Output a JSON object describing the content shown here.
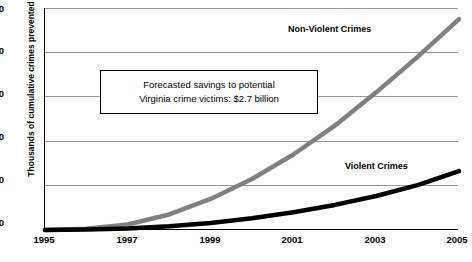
{
  "chart_data": {
    "type": "line",
    "title": "",
    "xlabel": "",
    "ylabel": "Thousands of cumulative crimes prevented",
    "xlim": [
      1995,
      2005
    ],
    "ylim": [
      0,
      100
    ],
    "grid": true,
    "legend_position": "inline-labels",
    "x_ticks": [
      "1995",
      "1997",
      "1999",
      "2001",
      "2003",
      "2005"
    ],
    "y_ticks": [
      "0",
      "20",
      "40",
      "60",
      "80",
      "100"
    ],
    "x": [
      1995,
      1996,
      1997,
      1998,
      1999,
      2000,
      2001,
      2002,
      2003,
      2004,
      2005
    ],
    "series": [
      {
        "name": "Non-Violent Crimes",
        "color": "#808080",
        "values": [
          0,
          0.6,
          2.5,
          7.0,
          14.0,
          23.0,
          34.0,
          47.0,
          62.0,
          78.0,
          95.0
        ]
      },
      {
        "name": "Violent Crimes",
        "color": "#000000",
        "values": [
          0,
          0.2,
          0.7,
          1.7,
          3.2,
          5.3,
          8.0,
          11.3,
          15.3,
          20.2,
          26.5
        ]
      }
    ],
    "annotations": [
      {
        "name": "forecast-savings-box",
        "lines": [
          "Forecasted savings to potential",
          "Virginia crime victims: $2.7 billion"
        ]
      }
    ]
  },
  "labels": {
    "nonviolent": "Non-Violent Crimes",
    "violent": "Violent Crimes"
  }
}
